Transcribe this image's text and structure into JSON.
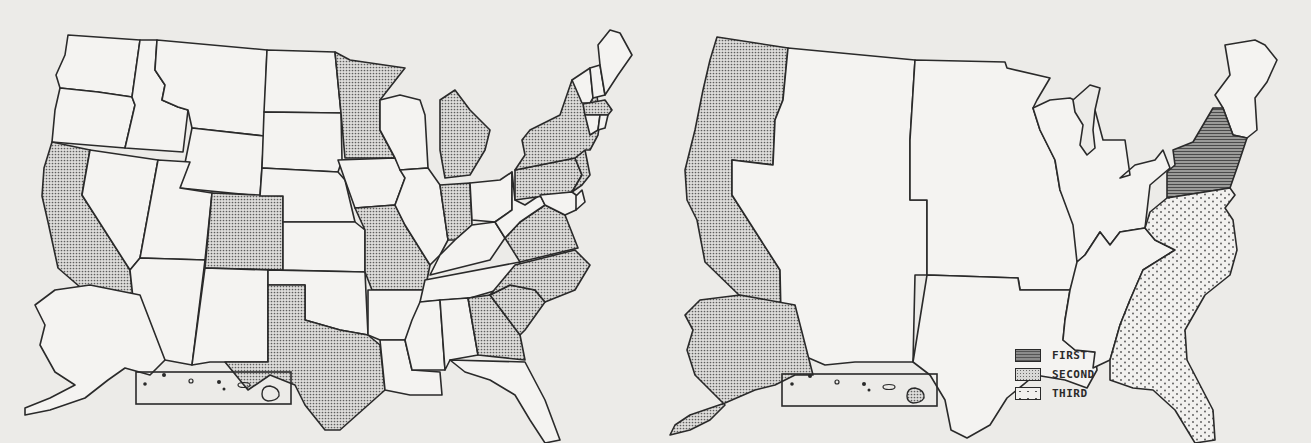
{
  "page": {
    "title_fragment": "",
    "background": "#ecebe8"
  },
  "patterns": {
    "FIRST": {
      "name": "dense-hatch",
      "color": "#8c8c8c"
    },
    "SECOND": {
      "name": "fine-dots",
      "color": "#d8d8d6"
    },
    "THIRD": {
      "name": "sparse-dots",
      "color": "#f1f0ee"
    },
    "NONE": {
      "name": "blank",
      "color": "#f4f3f1"
    }
  },
  "left_map": {
    "description": "US map by state; shaded states use the SECOND (fine dot) pattern",
    "shaded_states": [
      "California",
      "Colorado",
      "Texas",
      "Minnesota",
      "Missouri",
      "Michigan",
      "Indiana",
      "Georgia",
      "South Carolina",
      "North Carolina",
      "Virginia",
      "Pennsylvania",
      "New York",
      "New Jersey",
      "Massachusetts"
    ],
    "unshaded_states": [
      "Washington",
      "Oregon",
      "Idaho",
      "Montana",
      "Wyoming",
      "Nevada",
      "Utah",
      "Arizona",
      "New Mexico",
      "North Dakota",
      "South Dakota",
      "Nebraska",
      "Kansas",
      "Oklahoma",
      "Iowa",
      "Arkansas",
      "Louisiana",
      "Wisconsin",
      "Illinois",
      "Kentucky",
      "Tennessee",
      "Mississippi",
      "Alabama",
      "Florida",
      "Ohio",
      "West Virginia",
      "Maryland",
      "Delaware",
      "Maine",
      "New Hampshire",
      "Vermont",
      "Connecticut",
      "Rhode Island",
      "Alaska",
      "Hawaii"
    ],
    "insets": [
      "Alaska",
      "Hawaii"
    ]
  },
  "right_map": {
    "description": "US map by region",
    "regions": [
      {
        "name": "Pacific",
        "states": [
          "Washington",
          "Oregon",
          "California",
          "Alaska",
          "Hawaii"
        ],
        "rank": "SECOND"
      },
      {
        "name": "Mountain",
        "states": [
          "Idaho",
          "Montana",
          "Wyoming",
          "Nevada",
          "Utah",
          "Colorado",
          "Arizona",
          "New Mexico"
        ],
        "rank": "NONE"
      },
      {
        "name": "West North Central",
        "states": [
          "North Dakota",
          "South Dakota",
          "Nebraska",
          "Kansas",
          "Minnesota",
          "Iowa",
          "Missouri"
        ],
        "rank": "NONE"
      },
      {
        "name": "West South Central",
        "states": [
          "Oklahoma",
          "Texas",
          "Arkansas",
          "Louisiana"
        ],
        "rank": "NONE"
      },
      {
        "name": "East North Central",
        "states": [
          "Wisconsin",
          "Michigan",
          "Illinois",
          "Indiana",
          "Ohio"
        ],
        "rank": "NONE"
      },
      {
        "name": "East South Central",
        "states": [
          "Kentucky",
          "Tennessee",
          "Mississippi",
          "Alabama"
        ],
        "rank": "NONE"
      },
      {
        "name": "Middle Atlantic",
        "states": [
          "New York",
          "Pennsylvania",
          "New Jersey"
        ],
        "rank": "FIRST"
      },
      {
        "name": "South Atlantic",
        "states": [
          "West Virginia",
          "Maryland",
          "Delaware",
          "Virginia",
          "North Carolina",
          "South Carolina",
          "Georgia",
          "Florida"
        ],
        "rank": "THIRD"
      },
      {
        "name": "New England",
        "states": [
          "Maine",
          "New Hampshire",
          "Vermont",
          "Massachusetts",
          "Connecticut",
          "Rhode Island"
        ],
        "rank": "NONE"
      }
    ]
  },
  "legend": {
    "items": [
      {
        "label": "FIRST",
        "pattern": "dense-hatch"
      },
      {
        "label": "SECOND",
        "pattern": "fine-dots"
      },
      {
        "label": "THIRD",
        "pattern": "sparse-dots"
      }
    ]
  }
}
